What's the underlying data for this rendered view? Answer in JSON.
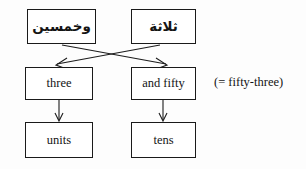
{
  "diagram": {
    "annotation": "(= fifty-three)",
    "nodes": {
      "wakhamsin": {
        "label": "وخمسين",
        "script": "arabic"
      },
      "thalatha": {
        "label": "ثلاثة",
        "script": "arabic"
      },
      "three": {
        "label": "three",
        "script": "latin"
      },
      "and_fifty": {
        "label": "and fifty",
        "script": "latin"
      },
      "units": {
        "label": "units",
        "script": "latin"
      },
      "tens": {
        "label": "tens",
        "script": "latin"
      }
    },
    "edges": [
      {
        "from": "wakhamsin",
        "to": "and_fifty",
        "kind": "crossing-arrow"
      },
      {
        "from": "thalatha",
        "to": "three",
        "kind": "crossing-arrow"
      },
      {
        "from": "three",
        "to": "units",
        "kind": "vertical-arrow"
      },
      {
        "from": "and_fifty",
        "to": "tens",
        "kind": "vertical-arrow"
      }
    ],
    "colors": {
      "background": "#fdfdfd",
      "box_border": "#1a1a1a",
      "text": "#141414",
      "edge": "#1c1c1c"
    }
  }
}
